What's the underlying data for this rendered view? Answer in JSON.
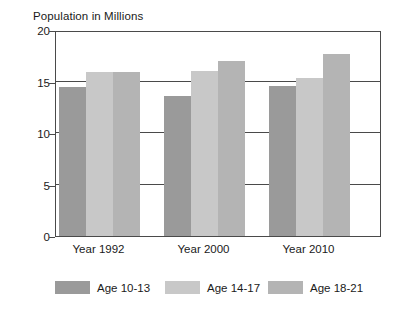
{
  "chart_data": {
    "type": "bar",
    "title": "Population in Millions",
    "xlabel": "",
    "ylabel": "",
    "categories": [
      "Year 1992",
      "Year 2000",
      "Year 2010"
    ],
    "series": [
      {
        "name": "Age 10-13",
        "color": "#9a9a9a",
        "values": [
          14.5,
          13.6,
          14.6
        ]
      },
      {
        "name": "Age 14-17",
        "color": "#c8c8c8",
        "values": [
          15.9,
          16.0,
          15.3
        ]
      },
      {
        "name": "Age 18-21",
        "color": "#b4b4b4",
        "values": [
          15.9,
          17.0,
          17.7
        ]
      }
    ],
    "ylim": [
      0,
      20
    ],
    "yticks": [
      0,
      5,
      10,
      15,
      20
    ],
    "ytick_labels": [
      "0",
      "5",
      "10",
      "15",
      "20"
    ],
    "grid": true,
    "grid_axis": "y",
    "legend_position": "bottom",
    "axis_color": "#4a4a4a",
    "background_color": "#ffffff"
  }
}
